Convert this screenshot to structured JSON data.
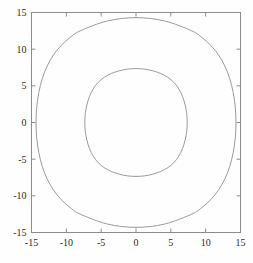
{
  "figure": {
    "title": "",
    "background_color": "#fefefe",
    "frame_color": "#8c8c8c",
    "tick_label_color": "#2b2b2b",
    "curve_color": "#8f8f8f"
  },
  "chart_data": {
    "type": "line",
    "title": "",
    "xlabel": "",
    "ylabel": "",
    "xlim": [
      -15,
      15
    ],
    "ylim": [
      -15,
      15
    ],
    "grid": false,
    "legend": "none",
    "xticks": [
      -15,
      -10,
      -5,
      0,
      5,
      10,
      15
    ],
    "yticks": [
      -15,
      -10,
      -5,
      0,
      5,
      10,
      15
    ],
    "xticklabels": [
      "-15",
      "-10",
      "-5",
      "0",
      "5",
      "10",
      "15"
    ],
    "yticklabels": [
      "15",
      "10",
      "5",
      "0",
      "-5",
      "-10",
      "-15"
    ],
    "series": [
      {
        "name": "inner-contour",
        "closed": true,
        "description": "inner closed rounded-diamond contour",
        "x": [
          7.35,
          7.28,
          7.05,
          6.68,
          6.15,
          5.45,
          4.58,
          3.55,
          2.4,
          1.2,
          0.0,
          -1.2,
          -2.4,
          -3.55,
          -4.58,
          -5.45,
          -6.15,
          -6.68,
          -7.05,
          -7.28,
          -7.35,
          -7.28,
          -7.05,
          -6.68,
          -6.15,
          -5.45,
          -4.58,
          -3.55,
          -2.4,
          -1.2,
          0.0,
          1.2,
          2.4,
          3.55,
          4.58,
          5.45,
          6.15,
          6.68,
          7.05,
          7.28,
          7.35
        ],
        "y": [
          0.0,
          1.2,
          2.4,
          3.55,
          4.58,
          5.45,
          6.15,
          6.68,
          7.05,
          7.28,
          7.35,
          7.28,
          7.05,
          6.68,
          6.15,
          5.45,
          4.58,
          3.55,
          2.4,
          1.2,
          0.0,
          -1.2,
          -2.4,
          -3.55,
          -4.58,
          -5.45,
          -6.15,
          -6.68,
          -7.05,
          -7.28,
          -7.35,
          -7.28,
          -7.05,
          -6.68,
          -6.15,
          -5.45,
          -4.58,
          -3.55,
          -2.4,
          -1.2,
          0.0
        ]
      },
      {
        "name": "outer-contour",
        "closed": true,
        "description": "outer closed rounded-diamond contour",
        "x": [
          14.35,
          14.25,
          13.95,
          13.45,
          12.75,
          11.85,
          10.75,
          9.45,
          8.0,
          4.1,
          0.0,
          -4.1,
          -8.0,
          -9.45,
          -10.75,
          -11.85,
          -12.75,
          -13.45,
          -13.95,
          -14.25,
          -14.35,
          -14.25,
          -13.95,
          -13.45,
          -12.75,
          -11.85,
          -10.75,
          -9.45,
          -8.0,
          -4.1,
          0.0,
          4.1,
          8.0,
          9.45,
          10.75,
          11.85,
          12.75,
          13.45,
          13.95,
          14.25,
          14.35
        ],
        "y": [
          0.0,
          2.1,
          4.1,
          6.0,
          7.7,
          9.2,
          10.5,
          11.6,
          12.5,
          13.85,
          14.3,
          13.85,
          12.5,
          11.6,
          10.5,
          9.2,
          7.7,
          6.0,
          4.1,
          2.1,
          0.0,
          -2.1,
          -4.1,
          -6.0,
          -7.7,
          -9.2,
          -10.5,
          -11.6,
          -12.5,
          -13.85,
          -14.3,
          -13.85,
          -12.5,
          -11.6,
          -10.5,
          -9.2,
          -7.7,
          -6.0,
          -4.1,
          -2.1,
          0.0
        ]
      }
    ]
  }
}
